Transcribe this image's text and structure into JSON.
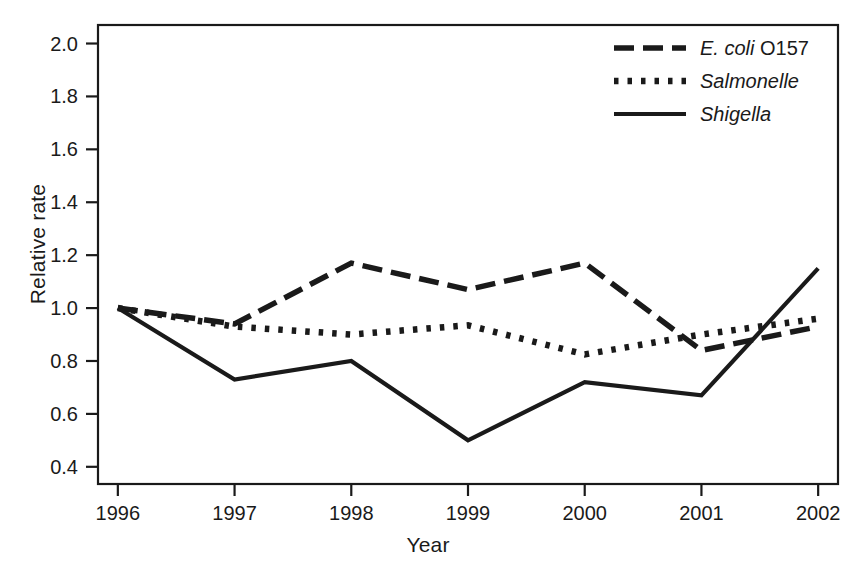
{
  "chart_data": {
    "type": "line",
    "title": "",
    "xlabel": "Year",
    "ylabel": "Relative rate",
    "categories": [
      "1996",
      "1997",
      "1998",
      "1999",
      "2000",
      "2001",
      "2002"
    ],
    "x": [
      1996,
      1997,
      1998,
      1999,
      2000,
      2001,
      2002
    ],
    "xlim": [
      1995.83,
      2002.17
    ],
    "ylim": [
      0.335,
      2.07
    ],
    "yticks": [
      0.4,
      0.6,
      0.8,
      1.0,
      1.2,
      1.4,
      1.6,
      1.8,
      2.0
    ],
    "ytick_labels": [
      "0.4",
      "0.6",
      "0.8",
      "1.0",
      "1.2",
      "1.4",
      "1.6",
      "1.8",
      "2.0"
    ],
    "xticks": [
      1996,
      1997,
      1998,
      1999,
      2000,
      2001,
      2002
    ],
    "xtick_labels": [
      "1996",
      "1997",
      "1998",
      "1999",
      "2000",
      "2001",
      "2002"
    ],
    "grid": false,
    "legend_position": "top-right",
    "frame": "box",
    "series": [
      {
        "name": "E. coli O157",
        "name_italic_part": "E. coli",
        "name_roman_part": " O157",
        "style": "dashed",
        "color": "#1a1a1a",
        "values": [
          1.0,
          0.94,
          1.17,
          1.07,
          1.17,
          0.84,
          0.93
        ]
      },
      {
        "name": "Salmonelle",
        "name_italic_part": "Salmonelle",
        "name_roman_part": "",
        "style": "dotted",
        "color": "#1a1a1a",
        "values": [
          1.0,
          0.93,
          0.9,
          0.935,
          0.825,
          0.9,
          0.96
        ]
      },
      {
        "name": "Shigella",
        "name_italic_part": "Shigella",
        "name_roman_part": "",
        "style": "solid",
        "color": "#1a1a1a",
        "values": [
          1.0,
          0.73,
          0.8,
          0.5,
          0.72,
          0.67,
          1.15
        ]
      }
    ]
  },
  "axes": {
    "y_title": "Relative rate",
    "x_title": "Year"
  },
  "legend": {
    "entries": [
      {
        "label": "E. coli O157",
        "italic": "E. coli",
        "roman": " O157",
        "style": "dashed"
      },
      {
        "label": "Salmonelle",
        "italic": "Salmonelle",
        "roman": "",
        "style": "dotted"
      },
      {
        "label": "Shigella",
        "italic": "Shigella",
        "roman": "",
        "style": "solid"
      }
    ]
  }
}
